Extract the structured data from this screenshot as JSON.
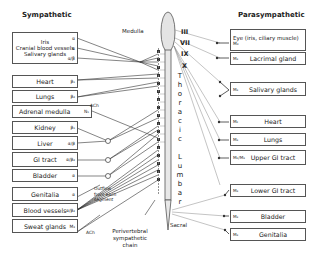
{
  "headers": {
    "sympathetic": "Sympathetic",
    "parasympathetic": "Parasympathetic"
  },
  "cord": {
    "medulla": "Medulla",
    "thoracic": [
      "T",
      "h",
      "o",
      "r",
      "a",
      "c",
      "i",
      "c"
    ],
    "lumbar": [
      "L",
      "u",
      "m",
      "b",
      "a",
      "r"
    ],
    "sacral": "Sacral",
    "chain_label": [
      "Perivertebral",
      "sympathetic",
      "chain"
    ],
    "outflow_label": [
      "Outflow",
      "from each",
      "segment"
    ],
    "ach_top": "ACh",
    "ach_bottom": "ACh"
  },
  "cranial_nerves": [
    "III",
    "VII",
    "IX",
    "X"
  ],
  "sympathetic": {
    "head_box": {
      "items": [
        {
          "label": "Iris",
          "receptor": "α"
        },
        {
          "label": "Cranial blood vessels",
          "receptor": "α"
        },
        {
          "label": "Salivary glands",
          "receptor": "α/β"
        }
      ]
    },
    "organs": [
      {
        "label": "Heart",
        "receptor": "β₁"
      },
      {
        "label": "Lungs",
        "receptor": "β₂"
      },
      {
        "label": "Adrenal medulla",
        "receptor": "N₁"
      },
      {
        "label": "Kidney",
        "receptor": "β₁"
      },
      {
        "label": "Liver",
        "receptor": "α/β"
      },
      {
        "label": "GI tract",
        "receptor": "α/β₂"
      },
      {
        "label": "Bladder",
        "receptor": "α"
      },
      {
        "label": "Genitalia",
        "receptor": "α"
      },
      {
        "label": "Blood vessels",
        "receptor": "α/β₂"
      },
      {
        "label": "Sweat glands",
        "receptor": "M₃"
      }
    ]
  },
  "parasympathetic": {
    "organs": [
      {
        "label": "Eye (iris, ciliary muscle)",
        "receptor": "M₃"
      },
      {
        "label": "Lacrimal gland",
        "receptor": "M₃"
      },
      {
        "label": "Salivary glands",
        "receptor": "M₃"
      },
      {
        "label": "Heart",
        "receptor": "M₂"
      },
      {
        "label": "Lungs",
        "receptor": "M₃"
      },
      {
        "label": "Upper GI tract",
        "receptor": "M₂/M₃"
      },
      {
        "label": "Lower GI tract",
        "receptor": "M₃"
      },
      {
        "label": "Bladder",
        "receptor": "M₃"
      },
      {
        "label": "Genitalia",
        "receptor": "M₃"
      }
    ]
  }
}
